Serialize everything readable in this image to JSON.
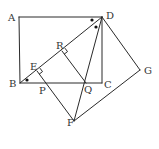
{
  "diagram": {
    "type": "geometry",
    "points": {
      "A": {
        "label": "A",
        "x": 19,
        "y": 17
      },
      "B": {
        "label": "B",
        "x": 20,
        "y": 83
      },
      "C": {
        "label": "C",
        "x": 102,
        "y": 83
      },
      "D": {
        "label": "D",
        "x": 102,
        "y": 17
      },
      "E": {
        "label": "E",
        "x": 37,
        "y": 71
      },
      "R": {
        "label": "R",
        "x": 62,
        "y": 51
      },
      "P": {
        "label": "P",
        "x": 45,
        "y": 83
      },
      "Q": {
        "label": "Q",
        "x": 86,
        "y": 83
      },
      "F": {
        "label": "F",
        "x": 74,
        "y": 121
      },
      "G": {
        "label": "G",
        "x": 140,
        "y": 70
      }
    },
    "segments": [
      [
        "A",
        "D"
      ],
      [
        "A",
        "B"
      ],
      [
        "B",
        "C"
      ],
      [
        "D",
        "C"
      ],
      [
        "B",
        "D"
      ],
      [
        "D",
        "F"
      ],
      [
        "D",
        "G"
      ],
      [
        "G",
        "F"
      ],
      [
        "E",
        "F"
      ],
      [
        "R",
        "Q"
      ]
    ],
    "right_angles": [
      "E",
      "R"
    ],
    "equal_angle_marks": [
      "ADB",
      "BDQ",
      "DBC"
    ]
  },
  "labels": {
    "A": "A",
    "B": "B",
    "C": "C",
    "D": "D",
    "E": "E",
    "F": "F",
    "G": "G",
    "P": "P",
    "Q": "Q",
    "R": "R"
  }
}
